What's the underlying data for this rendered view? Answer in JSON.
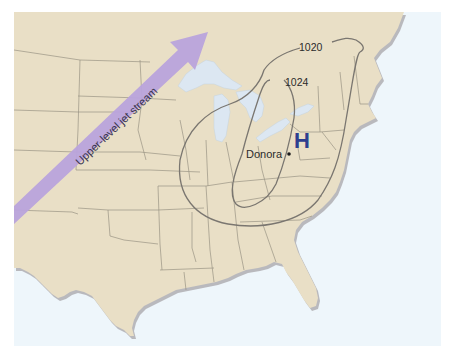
{
  "map": {
    "title": "Eastern United States surface pressure map",
    "colors": {
      "land": "#e9dfc6",
      "ocean": "#eef6fb",
      "lakes": "#dce7f2",
      "state_border": "#9a9384",
      "coast_shadow": "#b9b9bd",
      "isobar": "#7a7670",
      "high_pressure": "#2e3f8f",
      "jet_stream": "#b9a3dc",
      "jet_text": "#3a3550"
    },
    "jet_stream": {
      "label": "Upper-level jet stream"
    },
    "isobars": [
      {
        "value": "1020"
      },
      {
        "value": "1024"
      }
    ],
    "high_pressure": {
      "symbol": "H"
    },
    "city": {
      "name": "Donora"
    }
  }
}
